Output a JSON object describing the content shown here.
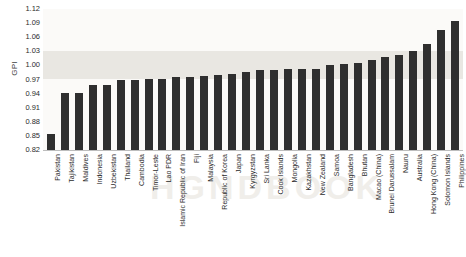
{
  "chart_data": {
    "type": "bar",
    "title": "",
    "xlabel": "",
    "ylabel": "GPI",
    "ylim": [
      0.82,
      1.12
    ],
    "yticks": [
      "1.12",
      "1.09",
      "1.06",
      "1.03",
      "1.00",
      "0.97",
      "0.94",
      "0.91",
      "0.88",
      "0.85",
      "0.82"
    ],
    "grid": false,
    "legend": null,
    "bar_color": "#2f2f2f",
    "parity_band": {
      "from": 0.97,
      "to": 1.03,
      "color": "#e9e7e2"
    },
    "categories": [
      "Pakistan",
      "Tajikistan",
      "Maldives",
      "Indonesia",
      "Uzbekistan",
      "Thailand",
      "Cambodia",
      "Timor-Leste",
      "Lao PDR",
      "Islamic Republic of Iran",
      "Fiji",
      "Malaysia",
      "Republic of Korea",
      "Japan",
      "Kyrgyzstan",
      "Sri Lanka",
      "Cook Islands",
      "Mongolia",
      "Kazakhstan",
      "New Zealand",
      "Samoa",
      "Bangladesh",
      "Bhutan",
      "Macao (China)",
      "Brunei Darussalam",
      "Nauru",
      "Australia",
      "Hong Kong (China)",
      "Solomon Islands",
      "Philippines"
    ],
    "values": [
      0.855,
      0.942,
      0.942,
      0.958,
      0.958,
      0.968,
      0.968,
      0.972,
      0.972,
      0.975,
      0.975,
      0.978,
      0.98,
      0.982,
      0.985,
      0.99,
      0.99,
      0.992,
      0.992,
      0.993,
      1.0,
      1.003,
      1.005,
      1.012,
      1.018,
      1.022,
      1.03,
      1.045,
      1.075,
      1.095
    ]
  },
  "watermark": {
    "text": "HGNDBOOK"
  }
}
